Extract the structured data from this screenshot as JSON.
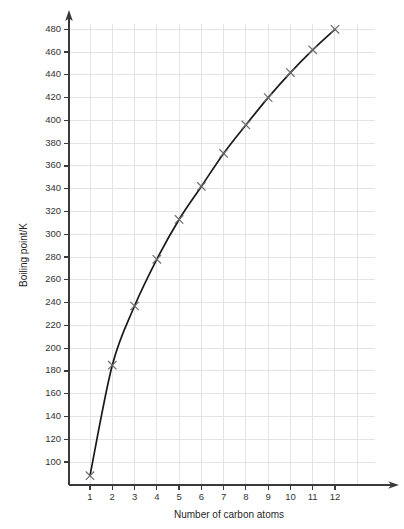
{
  "chart_data": {
    "type": "line",
    "title": "",
    "xlabel": "Number of carbon atoms",
    "ylabel": "Boiling point/K",
    "x": [
      1,
      2,
      3,
      4,
      5,
      6,
      7,
      8,
      9,
      10,
      11,
      12
    ],
    "values": [
      88,
      185,
      237,
      278,
      313,
      342,
      371,
      396,
      420,
      442,
      462,
      480
    ],
    "series": [
      {
        "name": "Boiling point",
        "values": [
          88,
          185,
          237,
          278,
          313,
          342,
          371,
          396,
          420,
          442,
          462,
          480
        ]
      }
    ],
    "xtick_labels": [
      "1",
      "2",
      "3",
      "4",
      "5",
      "6",
      "7",
      "8",
      "9",
      "10",
      "11",
      "12"
    ],
    "ytick_labels": [
      "100",
      "120",
      "140",
      "160",
      "180",
      "200",
      "220",
      "240",
      "260",
      "280",
      "300",
      "320",
      "340",
      "360",
      "380",
      "400",
      "420",
      "440",
      "460",
      "480"
    ],
    "ytick_values": [
      100,
      120,
      140,
      160,
      180,
      200,
      220,
      240,
      260,
      280,
      300,
      320,
      340,
      360,
      380,
      400,
      420,
      440,
      460,
      480
    ],
    "xlim": [
      0.45,
      13.1
    ],
    "ylim": [
      70,
      492
    ],
    "grid": true,
    "legend": "none",
    "marker": "x",
    "colors": {
      "curve": "#1a1a1a",
      "marker": "#6d6d6d",
      "grid": "#e3e3e3",
      "axis": "#3a3a3a",
      "text": "#2b2b2b",
      "background": "#ffffff"
    }
  }
}
